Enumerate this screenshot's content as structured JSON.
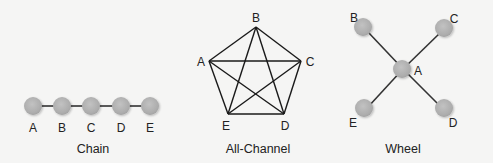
{
  "diagrams": [
    {
      "name": "chain",
      "caption": "Chain",
      "nodes": [
        {
          "id": "A",
          "label": "A"
        },
        {
          "id": "B",
          "label": "B"
        },
        {
          "id": "C",
          "label": "C"
        },
        {
          "id": "D",
          "label": "D"
        },
        {
          "id": "E",
          "label": "E"
        }
      ],
      "edges": [
        [
          "A",
          "B"
        ],
        [
          "B",
          "C"
        ],
        [
          "C",
          "D"
        ],
        [
          "D",
          "E"
        ]
      ]
    },
    {
      "name": "all-channel",
      "caption": "All-Channel",
      "nodes": [
        {
          "id": "A",
          "label": "A"
        },
        {
          "id": "B",
          "label": "B"
        },
        {
          "id": "C",
          "label": "C"
        },
        {
          "id": "D",
          "label": "D"
        },
        {
          "id": "E",
          "label": "E"
        }
      ],
      "edges": [
        [
          "A",
          "B"
        ],
        [
          "B",
          "C"
        ],
        [
          "C",
          "D"
        ],
        [
          "D",
          "E"
        ],
        [
          "E",
          "A"
        ],
        [
          "A",
          "C"
        ],
        [
          "A",
          "D"
        ],
        [
          "B",
          "D"
        ],
        [
          "B",
          "E"
        ],
        [
          "C",
          "E"
        ]
      ]
    },
    {
      "name": "wheel",
      "caption": "Wheel",
      "nodes": [
        {
          "id": "A",
          "label": "A"
        },
        {
          "id": "B",
          "label": "B"
        },
        {
          "id": "C",
          "label": "C"
        },
        {
          "id": "D",
          "label": "D"
        },
        {
          "id": "E",
          "label": "E"
        }
      ],
      "edges": [
        [
          "A",
          "B"
        ],
        [
          "A",
          "C"
        ],
        [
          "A",
          "D"
        ],
        [
          "A",
          "E"
        ]
      ]
    }
  ],
  "colors": {
    "node_fill": "#b3b3b3",
    "edge": "#333333",
    "background": "#f5f5f4"
  }
}
